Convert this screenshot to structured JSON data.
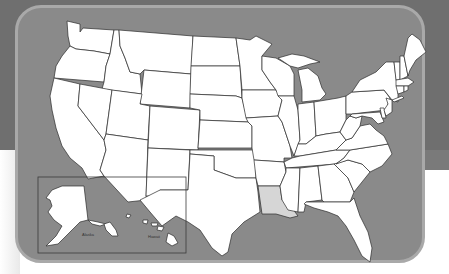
{
  "map": {
    "title": "United States",
    "highlighted_state": "Louisiana",
    "colors": {
      "outer_background": "#6f6f6f",
      "panel_fill": "#8a8a8a",
      "panel_border": "#a9a9a9",
      "state_fill": "#ffffff",
      "highlight_fill": "#d6d6d6",
      "state_border": "#2b2b2b"
    },
    "inset": {
      "labels": [
        "Alaska",
        "Hawaii"
      ]
    }
  }
}
